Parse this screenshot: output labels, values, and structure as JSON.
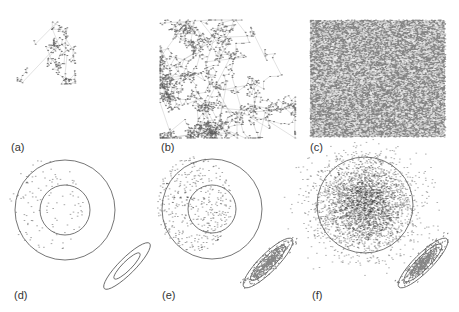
{
  "figure": {
    "panels": [
      {
        "id": "a",
        "label": "(a)",
        "label_pos": [
          11,
          141
        ],
        "type": "walk",
        "box": [
          15,
          22,
          60,
          62
        ],
        "steps": 160,
        "density": "sparse",
        "seed": 11
      },
      {
        "id": "b",
        "label": "(b)",
        "label_pos": [
          161,
          141
        ],
        "type": "walk",
        "box": [
          160,
          20,
          135,
          118
        ],
        "steps": 1400,
        "density": "medium",
        "seed": 23
      },
      {
        "id": "c",
        "label": "(c)",
        "label_pos": [
          310,
          141
        ],
        "type": "fill",
        "box": [
          310,
          20,
          135,
          117
        ],
        "steps": 9000,
        "density": "dense",
        "seed": 37
      },
      {
        "id": "d",
        "label": "(d)",
        "label_pos": [
          14,
          289
        ],
        "type": "circles",
        "circle_center": [
          65,
          210
        ],
        "radii": [
          50,
          25
        ],
        "ellipse": {
          "cx": 127,
          "cy": 266,
          "rx": [
            32,
            18
          ],
          "ry": [
            8,
            4.5
          ],
          "angle": -45
        },
        "scatter": 120,
        "ellipse_fill": 0,
        "seed": 41
      },
      {
        "id": "e",
        "label": "(e)",
        "label_pos": [
          162,
          289
        ],
        "type": "circles",
        "circle_center": [
          212,
          209
        ],
        "radii": [
          50,
          24
        ],
        "ellipse": {
          "cx": 268,
          "cy": 263,
          "rx": [
            34,
            24
          ],
          "ry": [
            9,
            6
          ],
          "angle": -45
        },
        "scatter": 420,
        "ellipse_fill": 450,
        "seed": 53
      },
      {
        "id": "f",
        "label": "(f)",
        "label_pos": [
          312,
          289
        ],
        "type": "circles",
        "circle_center": [
          365,
          205
        ],
        "radii": [
          48
        ],
        "ellipse": {
          "cx": 423,
          "cy": 263,
          "rx": [
            34,
            26
          ],
          "ry": [
            9,
            6.5
          ],
          "angle": -45
        },
        "scatter": 3200,
        "ellipse_fill": 500,
        "seed": 67
      }
    ]
  }
}
